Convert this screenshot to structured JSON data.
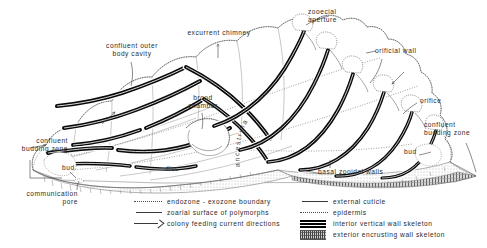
{
  "annotations": [
    {
      "id": "confluent-outer-body-cavity",
      "text_line1": "confluent outer",
      "text_line2": "body cavity"
    },
    {
      "id": "excurrent-chimney",
      "text": "excurrent chimney"
    },
    {
      "id": "zooecial-aperture",
      "text_line1": "zooecial",
      "text_line2": "aperture"
    },
    {
      "id": "orificial-wall",
      "text": "orificial wall"
    },
    {
      "id": "orifice",
      "text": "orifice"
    },
    {
      "id": "brood-chamber",
      "text_line1": "brood",
      "text_line2": "chamber"
    },
    {
      "id": "ancestrula",
      "text": "ancestrula"
    },
    {
      "id": "confluent-budding-zone-left",
      "text_line1": "confluent",
      "text_line2": "budding  zone"
    },
    {
      "id": "confluent-budding-zone-right",
      "text_line1": "confluent",
      "text_line2": "budding  zone"
    },
    {
      "id": "bud-left",
      "text": "bud"
    },
    {
      "id": "bud-right",
      "text": "bud"
    },
    {
      "id": "disc",
      "text": "disc"
    },
    {
      "id": "basal-zooidal-walls",
      "text": "basal  zooidal  walls"
    },
    {
      "id": "communication-pore",
      "text_line1": "communication",
      "text_line2": "pore"
    }
  ],
  "legend_left": {
    "items": [
      {
        "swatch": "dotted-line",
        "label": "endozone  -  exozone  boundary"
      },
      {
        "swatch": "thin-solid-line",
        "label": "zoarial  surface  of  polymorphs"
      },
      {
        "swatch": "arrow-line",
        "label": "colony  feeding  current  directions"
      }
    ]
  },
  "legend_right": {
    "items": [
      {
        "swatch": "thin-solid-line",
        "label": "external  cuticle"
      },
      {
        "swatch": "dotted-line",
        "label": "epidermis"
      },
      {
        "swatch": "thick-black-band",
        "label": "interior  vertical  wall  skeleton"
      },
      {
        "swatch": "hatched-band",
        "label": "exterior  encrusting  wall  skeleton"
      }
    ]
  },
  "colors": {
    "ink": "#1a1a1a",
    "paper": "#ffffff",
    "skeleton_black": "#0a0a0a",
    "faint_grey": "#8d8d8d",
    "stipple_grey": "#b5b5b5"
  }
}
